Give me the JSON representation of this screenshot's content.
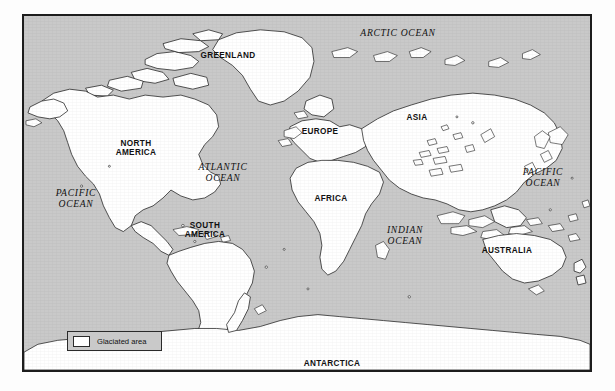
{
  "figure": {
    "kind": "world-map",
    "projection": "cylindrical",
    "ocean_fill": "#c9c9c9",
    "land_fill": "#ffffff",
    "outline_color": "#1d1d1d",
    "border_color": "#1d1d1d",
    "page_background": "#fdfdfd"
  },
  "legend": {
    "swatch_fill": "#ffffff",
    "label": "Glaciated area"
  },
  "labels": {
    "continents": [
      {
        "id": "greenland",
        "text": "GREENLAND",
        "x": 226,
        "y": 54,
        "lines": 1
      },
      {
        "id": "north-america",
        "text": "NORTH\nAMERICA",
        "x": 134,
        "y": 146,
        "lines": 2
      },
      {
        "id": "europe",
        "text": "EUROPE",
        "x": 318,
        "y": 130,
        "lines": 1
      },
      {
        "id": "asia",
        "text": "ASIA",
        "x": 415,
        "y": 116,
        "lines": 1
      },
      {
        "id": "africa",
        "text": "AFRICA",
        "x": 329,
        "y": 197,
        "lines": 1
      },
      {
        "id": "south-america",
        "text": "SOUTH\nAMERICA",
        "x": 203,
        "y": 228,
        "lines": 2
      },
      {
        "id": "australia",
        "text": "AUSTRALIA",
        "x": 505,
        "y": 249,
        "lines": 1
      },
      {
        "id": "antarctica",
        "text": "ANTARCTICA",
        "x": 330,
        "y": 362,
        "lines": 1
      }
    ],
    "oceans": [
      {
        "id": "arctic-ocean",
        "text": "ARCTIC OCEAN",
        "x": 396,
        "y": 30,
        "lines": 1
      },
      {
        "id": "atlantic-ocean",
        "text": "ATLANTIC\nOCEAN",
        "x": 221,
        "y": 170,
        "lines": 2
      },
      {
        "id": "pacific-ocean-w",
        "text": "PACIFIC\nOCEAN",
        "x": 74,
        "y": 196,
        "lines": 2
      },
      {
        "id": "pacific-ocean-e",
        "text": "PACIFIC\nOCEAN",
        "x": 541,
        "y": 175,
        "lines": 2
      },
      {
        "id": "indian-ocean",
        "text": "INDIAN\nOCEAN",
        "x": 403,
        "y": 233,
        "lines": 2
      }
    ]
  }
}
